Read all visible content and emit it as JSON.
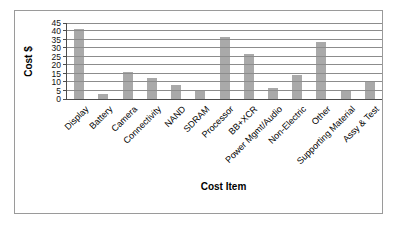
{
  "chart": {
    "frame_border_color": "#9a9a9a",
    "bar_color": "#a9a9a9",
    "gridline_color": "#8c8c8c",
    "axis_color": "#4d4d4d",
    "text_color": "#000000"
  },
  "chart_data": {
    "type": "bar",
    "title": "",
    "xlabel": "Cost Item",
    "ylabel": "Cost $",
    "ylim": [
      0,
      45
    ],
    "ytick_interval": 5,
    "yticks": [
      0,
      5,
      10,
      15,
      20,
      25,
      30,
      35,
      40,
      45
    ],
    "grid": true,
    "legend": false,
    "categories": [
      "Display",
      "Battery",
      "Camera",
      "Connectivity",
      "NAND",
      "SDRAM",
      "Processor",
      "BB+XCR",
      "Power Mgmt/Audio",
      "Non-Electric",
      "Other",
      "Supporting Material",
      "Assy & Test"
    ],
    "values": [
      41.5,
      3,
      16,
      12.5,
      8.5,
      5,
      36.5,
      26.5,
      6.5,
      14.5,
      34,
      5.5,
      10
    ]
  }
}
